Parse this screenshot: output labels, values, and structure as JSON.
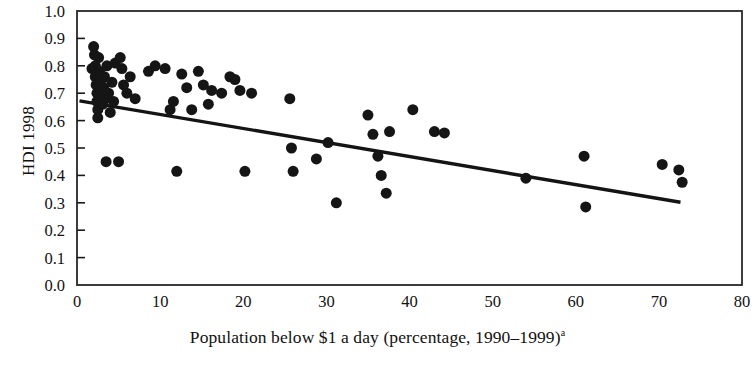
{
  "chart_data": {
    "type": "scatter",
    "title": "",
    "xlabel": "Population below $1 a day (percentage, 1990–1999)",
    "xlabel_superscript": "a",
    "ylabel": "HDI 1998",
    "xlim": [
      0,
      80
    ],
    "ylim": [
      0,
      1.0
    ],
    "xticks": [
      0,
      10,
      20,
      30,
      40,
      50,
      60,
      70,
      80
    ],
    "xtick_labels": [
      "0",
      "10",
      "20",
      "30",
      "40",
      "50",
      "60",
      "70",
      "80"
    ],
    "yticks": [
      0.0,
      0.1,
      0.2,
      0.3,
      0.4,
      0.5,
      0.6,
      0.7,
      0.8,
      0.9,
      1.0
    ],
    "ytick_labels": [
      "0.0",
      "0.1",
      "0.2",
      "0.3",
      "0.4",
      "0.5",
      "0.6",
      "0.7",
      "0.8",
      "0.9",
      "1.0"
    ],
    "grid": false,
    "legend": false,
    "marker_color": "#151515",
    "marker_size_px": 11,
    "trendline": {
      "type": "linear",
      "color": "#141414",
      "x_start": 0.3,
      "y_start": 0.672,
      "x_end": 72.6,
      "y_end": 0.302
    },
    "points": [
      {
        "x": 1.8,
        "y": 0.79
      },
      {
        "x": 2.0,
        "y": 0.87
      },
      {
        "x": 2.1,
        "y": 0.84
      },
      {
        "x": 2.2,
        "y": 0.8
      },
      {
        "x": 2.2,
        "y": 0.76
      },
      {
        "x": 2.3,
        "y": 0.73
      },
      {
        "x": 2.4,
        "y": 0.7
      },
      {
        "x": 2.4,
        "y": 0.67
      },
      {
        "x": 2.5,
        "y": 0.64
      },
      {
        "x": 2.5,
        "y": 0.61
      },
      {
        "x": 2.6,
        "y": 0.83
      },
      {
        "x": 2.7,
        "y": 0.78
      },
      {
        "x": 2.8,
        "y": 0.74
      },
      {
        "x": 2.9,
        "y": 0.71
      },
      {
        "x": 3.0,
        "y": 0.69
      },
      {
        "x": 3.1,
        "y": 0.66
      },
      {
        "x": 3.2,
        "y": 0.72
      },
      {
        "x": 3.3,
        "y": 0.76
      },
      {
        "x": 3.4,
        "y": 0.68
      },
      {
        "x": 3.5,
        "y": 0.45
      },
      {
        "x": 3.6,
        "y": 0.8
      },
      {
        "x": 3.8,
        "y": 0.7
      },
      {
        "x": 4.0,
        "y": 0.63
      },
      {
        "x": 4.2,
        "y": 0.74
      },
      {
        "x": 4.4,
        "y": 0.67
      },
      {
        "x": 4.6,
        "y": 0.81
      },
      {
        "x": 5.0,
        "y": 0.45
      },
      {
        "x": 5.2,
        "y": 0.83
      },
      {
        "x": 5.4,
        "y": 0.79
      },
      {
        "x": 5.6,
        "y": 0.73
      },
      {
        "x": 6.0,
        "y": 0.7
      },
      {
        "x": 6.4,
        "y": 0.76
      },
      {
        "x": 7.0,
        "y": 0.68
      },
      {
        "x": 8.6,
        "y": 0.78
      },
      {
        "x": 9.4,
        "y": 0.8
      },
      {
        "x": 10.6,
        "y": 0.79
      },
      {
        "x": 11.2,
        "y": 0.64
      },
      {
        "x": 11.6,
        "y": 0.67
      },
      {
        "x": 12.0,
        "y": 0.415
      },
      {
        "x": 12.6,
        "y": 0.77
      },
      {
        "x": 13.2,
        "y": 0.72
      },
      {
        "x": 13.8,
        "y": 0.64
      },
      {
        "x": 14.6,
        "y": 0.78
      },
      {
        "x": 15.2,
        "y": 0.73
      },
      {
        "x": 15.8,
        "y": 0.66
      },
      {
        "x": 16.2,
        "y": 0.71
      },
      {
        "x": 17.4,
        "y": 0.7
      },
      {
        "x": 18.4,
        "y": 0.76
      },
      {
        "x": 19.0,
        "y": 0.75
      },
      {
        "x": 19.6,
        "y": 0.71
      },
      {
        "x": 20.2,
        "y": 0.415
      },
      {
        "x": 21.0,
        "y": 0.7
      },
      {
        "x": 25.6,
        "y": 0.68
      },
      {
        "x": 25.8,
        "y": 0.5
      },
      {
        "x": 26.0,
        "y": 0.415
      },
      {
        "x": 28.8,
        "y": 0.46
      },
      {
        "x": 30.2,
        "y": 0.52
      },
      {
        "x": 31.2,
        "y": 0.3
      },
      {
        "x": 35.0,
        "y": 0.62
      },
      {
        "x": 35.6,
        "y": 0.55
      },
      {
        "x": 36.2,
        "y": 0.47
      },
      {
        "x": 36.6,
        "y": 0.4
      },
      {
        "x": 37.2,
        "y": 0.335
      },
      {
        "x": 37.6,
        "y": 0.56
      },
      {
        "x": 40.4,
        "y": 0.64
      },
      {
        "x": 43.0,
        "y": 0.56
      },
      {
        "x": 44.2,
        "y": 0.555
      },
      {
        "x": 54.0,
        "y": 0.39
      },
      {
        "x": 61.0,
        "y": 0.47
      },
      {
        "x": 61.2,
        "y": 0.285
      },
      {
        "x": 70.4,
        "y": 0.44
      },
      {
        "x": 72.4,
        "y": 0.42
      },
      {
        "x": 72.8,
        "y": 0.375
      }
    ]
  }
}
